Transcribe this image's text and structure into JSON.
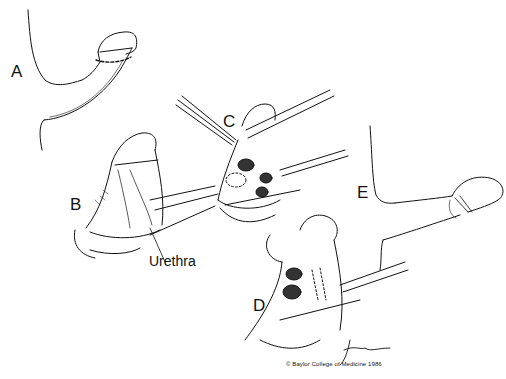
{
  "figure": {
    "panels": [
      {
        "id": "A",
        "label": "A"
      },
      {
        "id": "B",
        "label": "B"
      },
      {
        "id": "C",
        "label": "C"
      },
      {
        "id": "D",
        "label": "D"
      },
      {
        "id": "E",
        "label": "E"
      }
    ],
    "annotations": {
      "urethra": "Urethra"
    },
    "copyright": "© Baylor College of Medicine 1986",
    "colors": {
      "background": "#ffffff",
      "ink": "#111111"
    }
  }
}
